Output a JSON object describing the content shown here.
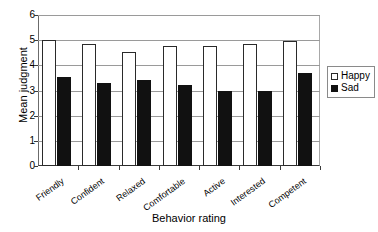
{
  "chart_data": {
    "type": "bar",
    "title": "",
    "xlabel": "Behavior rating",
    "ylabel": "Mean judgment",
    "ylim": [
      0,
      6
    ],
    "yticks": [
      0,
      1,
      2,
      3,
      4,
      5,
      6
    ],
    "grid": true,
    "legend_position": "right",
    "categories": [
      "Friendly",
      "Confident",
      "Relaxed",
      "Comfortable",
      "Active",
      "Interested",
      "Competent"
    ],
    "series": [
      {
        "name": "Happy",
        "color": "#ffffff",
        "values": [
          5.0,
          4.85,
          4.55,
          4.75,
          4.75,
          4.85,
          4.95
        ]
      },
      {
        "name": "Sad",
        "color": "#111111",
        "values": [
          3.55,
          3.3,
          3.4,
          3.2,
          3.0,
          3.0,
          3.7
        ]
      }
    ]
  },
  "legend": {
    "items": [
      {
        "label": "Happy",
        "swatch": "hollow-square-icon"
      },
      {
        "label": "Sad",
        "swatch": "filled-square-icon"
      }
    ]
  }
}
